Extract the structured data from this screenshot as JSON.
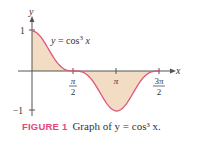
{
  "chart_data": {
    "type": "line",
    "title": "",
    "function": "y = cos^3 x",
    "curve_label": "y = cos³ x",
    "xlabel": "x",
    "ylabel": "y",
    "x_ticks": [
      "π/2",
      "π",
      "3π/2"
    ],
    "x_tick_values": [
      1.5708,
      3.1416,
      4.7124
    ],
    "y_ticks": [
      "1",
      "−1"
    ],
    "y_tick_values": [
      1,
      -1
    ],
    "xlim": [
      0,
      4.7124
    ],
    "ylim": [
      -1,
      1
    ],
    "filled_area": true,
    "grid": false,
    "legend": "none",
    "x": [
      0,
      0.3927,
      0.7854,
      1.1781,
      1.5708,
      1.9635,
      2.3562,
      2.7489,
      3.1416,
      3.5343,
      3.927,
      4.3197,
      4.7124
    ],
    "values": [
      1,
      0.789,
      0.354,
      0.056,
      0,
      -0.056,
      -0.354,
      -0.789,
      -1,
      -0.789,
      -0.354,
      -0.056,
      0
    ]
  },
  "colors": {
    "curve": "#e0557a",
    "fill": "#f2dcc4",
    "axis": "#555555",
    "figure_label": "#e5467a"
  },
  "labels": {
    "y_axis": "y",
    "x_axis": "x",
    "y_one": "1",
    "y_neg_one": "−1",
    "curve_eq_y": "y",
    "curve_eq_rest": " = cos",
    "curve_eq_exp": "3",
    "curve_eq_x": " x",
    "tick_pi_half_num": "π",
    "tick_pi_half_den": "2",
    "tick_pi": "π",
    "tick_3pi_half_num": "3π",
    "tick_3pi_half_den": "2"
  },
  "caption": {
    "figure_label": "FIGURE 1",
    "text": "Graph of y = cos³ x."
  }
}
